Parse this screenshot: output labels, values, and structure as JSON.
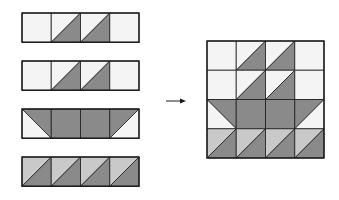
{
  "colors": {
    "white": "#f4f4f4",
    "light": "#c9c9c9",
    "dark": "#8a8a8a",
    "stroke": "#1a1a1a",
    "arrow": "#1a1a1a"
  },
  "cell_size": 29.25,
  "strips": [
    {
      "name": "row-1",
      "x": 22,
      "y": 13,
      "cells": [
        "W",
        "WD",
        "WD",
        "W"
      ]
    },
    {
      "name": "row-2",
      "x": 22,
      "y": 61,
      "cells": [
        "W",
        "WD",
        "WD",
        "W"
      ]
    },
    {
      "name": "row-3",
      "x": 22,
      "y": 109,
      "cells": [
        "DWL",
        "D",
        "D",
        "DWR"
      ]
    },
    {
      "name": "row-4",
      "x": 22,
      "y": 157,
      "cells": [
        "LD",
        "LD",
        "LD",
        "LD"
      ]
    }
  ],
  "arrow": {
    "x1": 166,
    "x2": 186,
    "y": 101
  },
  "block": {
    "x": 207,
    "y": 41,
    "rows": [
      [
        "W",
        "WD",
        "WD",
        "W"
      ],
      [
        "W",
        "WD",
        "WD",
        "W"
      ],
      [
        "DWL",
        "D",
        "D",
        "DWR"
      ],
      [
        "LD",
        "LD",
        "LD",
        "LD"
      ]
    ]
  }
}
